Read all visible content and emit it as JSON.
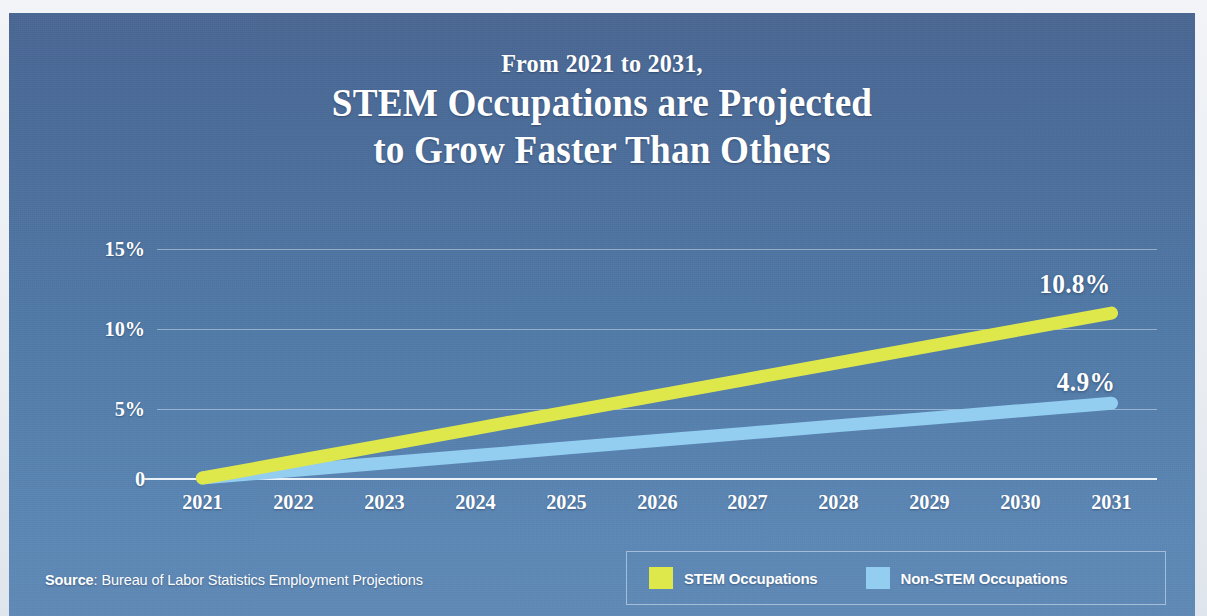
{
  "panel": {
    "background_top_color": "#4a6793",
    "background_bottom_color": "#6089b6"
  },
  "title": {
    "kicker": "From 2021 to 2031,",
    "line1": "STEM Occupations are Projected",
    "line2": "to Grow Faster Than Others"
  },
  "axis": {
    "y_ticks": [
      "15%",
      "10%",
      "5%",
      "0"
    ],
    "x_ticks": [
      "2021",
      "2022",
      "2023",
      "2024",
      "2025",
      "2026",
      "2027",
      "2028",
      "2029",
      "2030",
      "2031"
    ]
  },
  "callouts": {
    "stem_value": "10.8%",
    "nonstem_value": "4.9%"
  },
  "legend": {
    "stem_label": "STEM Occupations",
    "nonstem_label": "Non-STEM Occupations",
    "stem_color": "#dfe84b",
    "nonstem_color": "#93cdf0"
  },
  "source": {
    "prefix": "Source",
    "text": ": Bureau of Labor Statistics Employment Projections",
    "full": "Source: Bureau of Labor Statistics Employment Projections"
  },
  "chart_data": {
    "type": "line",
    "title": "From 2021 to 2031, STEM Occupations are Projected to Grow Faster Than Others",
    "subtitle": "",
    "xlabel": "",
    "ylabel": "",
    "x": [
      2021,
      2022,
      2023,
      2024,
      2025,
      2026,
      2027,
      2028,
      2029,
      2030,
      2031
    ],
    "series": [
      {
        "name": "STEM Occupations",
        "color": "#dfe84b",
        "values": [
          0,
          1.08,
          2.16,
          3.24,
          4.32,
          5.4,
          6.48,
          7.56,
          8.64,
          9.72,
          10.8
        ],
        "end_label": "10.8%"
      },
      {
        "name": "Non-STEM Occupations",
        "color": "#93cdf0",
        "values": [
          0,
          0.49,
          0.98,
          1.47,
          1.96,
          2.45,
          2.94,
          3.43,
          3.92,
          4.41,
          4.9
        ],
        "end_label": "4.9%"
      }
    ],
    "ylim": [
      0,
      15
    ],
    "ytick_values": [
      0,
      5,
      10,
      15
    ],
    "ytick_labels": [
      "0",
      "5%",
      "10%",
      "15%"
    ],
    "xtick_labels": [
      "2021",
      "2022",
      "2023",
      "2024",
      "2025",
      "2026",
      "2027",
      "2028",
      "2029",
      "2030",
      "2031"
    ],
    "grid": true,
    "legend_position": "bottom-right",
    "units": "percent cumulative growth",
    "annotations": [
      "10.8%",
      "4.9%"
    ]
  }
}
